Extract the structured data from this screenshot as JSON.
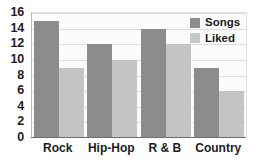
{
  "chart_data": {
    "type": "bar",
    "title": "",
    "xlabel": "",
    "ylabel": "",
    "categories": [
      "Rock",
      "Hip-Hop",
      "R & B",
      "Country"
    ],
    "series": [
      {
        "name": "Songs",
        "values": [
          15,
          12,
          14,
          9
        ],
        "color": "#8c8c8c"
      },
      {
        "name": "Liked",
        "values": [
          9,
          10,
          12,
          6
        ],
        "color": "#c4c4c4"
      }
    ],
    "ylim": [
      0,
      16
    ],
    "ytick_step": 2,
    "yticks": [
      16,
      14,
      12,
      10,
      8,
      6,
      4,
      2,
      0
    ],
    "grid": true,
    "legend_position": "top-right"
  },
  "legend": {
    "entries": [
      {
        "label": "Songs",
        "swatch": "songs-swatch"
      },
      {
        "label": "Liked",
        "swatch": "liked-swatch"
      }
    ]
  },
  "colors": {
    "songs": "#8c8c8c",
    "liked": "#c4c4c4",
    "gridline": "#dcdcdc",
    "axis": "#6e6e6e",
    "text": "#1c1c1c",
    "plot_background": "#fbfbfb"
  }
}
